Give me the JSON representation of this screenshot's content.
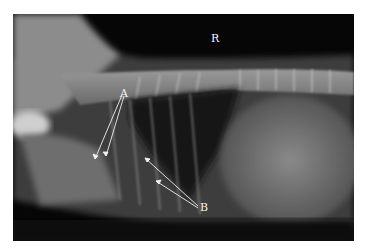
{
  "image": {
    "description": "Lateral thoracic/abdominal radiograph of a small animal with annotation labels",
    "orientation_marker": "R",
    "labels": [
      {
        "text": "A",
        "x": 123,
        "y": 93
      },
      {
        "text": "B",
        "x": 203,
        "y": 207
      }
    ]
  }
}
